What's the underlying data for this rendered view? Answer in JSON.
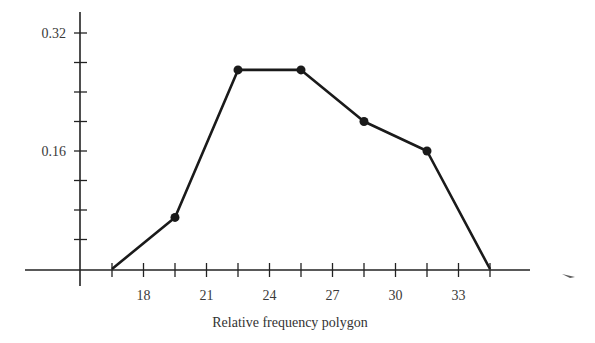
{
  "chart_data": {
    "type": "line",
    "title": "Relative frequency polygon",
    "xlabel": "",
    "ylabel": "",
    "x": [
      16.5,
      19.5,
      22.5,
      25.5,
      28.5,
      31.5,
      34.5
    ],
    "values": [
      0,
      0.07,
      0.27,
      0.27,
      0.2,
      0.16,
      0
    ],
    "marked_points": [
      false,
      true,
      true,
      true,
      true,
      true,
      false
    ],
    "xlim": [
      15,
      37
    ],
    "ylim": [
      0,
      0.34
    ],
    "x_tick_labels": [
      "18",
      "21",
      "24",
      "27",
      "30",
      "33"
    ],
    "x_tick_values": [
      18,
      21,
      24,
      27,
      30,
      33
    ],
    "x_minor_ticks": [
      16.5,
      18,
      19.5,
      21,
      22.5,
      24,
      25.5,
      27,
      28.5,
      30,
      31.5,
      33,
      34.5
    ],
    "y_tick_labels": [
      "0.16",
      "0.32"
    ],
    "y_tick_values": [
      0.16,
      0.32
    ],
    "y_minor_ticks": [
      0.04,
      0.08,
      0.12,
      0.16,
      0.2,
      0.24,
      0.28,
      0.32
    ],
    "grid": false,
    "legend": null
  },
  "colors": {
    "line": "#1a1a1a",
    "axis": "#222222",
    "text": "#3a3a3a"
  }
}
